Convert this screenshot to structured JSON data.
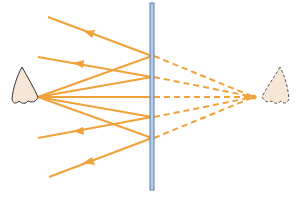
{
  "diagram": {
    "type": "plane-mirror-virtual-image",
    "colors": {
      "ray": "#f0a23a",
      "mirror_fill": "#b7cde6",
      "mirror_stroke": "#5a7aa8",
      "nose_fill": "#f7e6d6",
      "nose_stroke": "#333333",
      "background": "#ffffff"
    },
    "mirror": {
      "x": 152,
      "y1": 3,
      "y2": 190
    },
    "eye": {
      "label": "nose-observer",
      "apex": [
        38,
        97
      ]
    },
    "virtual_image": {
      "label": "virtual-image-nose",
      "apex": [
        254,
        97
      ]
    },
    "rays": [
      {
        "start": [
          48,
          17
        ],
        "hit": [
          152,
          56
        ]
      },
      {
        "start": [
          38,
          57
        ],
        "hit": [
          152,
          77
        ]
      },
      {
        "start": [
          38,
          97
        ],
        "hit": [
          152,
          97
        ]
      },
      {
        "start": [
          38,
          138
        ],
        "hit": [
          152,
          117
        ]
      },
      {
        "start": [
          49,
          177
        ],
        "hit": [
          152,
          138
        ]
      }
    ]
  }
}
